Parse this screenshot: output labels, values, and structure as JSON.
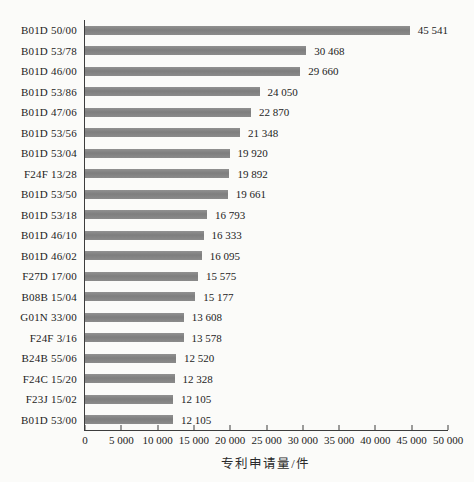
{
  "chart_data": {
    "type": "bar",
    "orientation": "horizontal",
    "xlabel": "专利申请量/件",
    "ylabel": "",
    "xlim": [
      0,
      50000
    ],
    "grid": false,
    "legend": "none",
    "bar_color": "#848484",
    "axis_color": "#3d3d3d",
    "categories": [
      "B01D 50/00",
      "B01D 53/78",
      "B01D 46/00",
      "B01D 53/86",
      "B01D 47/06",
      "B01D 53/56",
      "B01D 53/04",
      "F24F 13/28",
      "B01D 53/50",
      "B01D 53/18",
      "B01D 46/10",
      "B01D 46/02",
      "F27D 17/00",
      "B08B 15/04",
      "G01N 33/00",
      "F24F 3/16",
      "B24B 55/06",
      "F24C 15/20",
      "F23J 15/02",
      "B01D 53/00"
    ],
    "values": [
      45541,
      30468,
      29660,
      24050,
      22870,
      21348,
      19920,
      19892,
      19661,
      16793,
      16333,
      16095,
      15575,
      15177,
      13608,
      13578,
      12520,
      12328,
      12105,
      12105
    ],
    "value_labels": [
      "45 541",
      "30 468",
      "29 660",
      "24 050",
      "22 870",
      "21 348",
      "19 920",
      "19 892",
      "19 661",
      "16 793",
      "16 333",
      "16 095",
      "15 575",
      "15 177",
      "13 608",
      "13 578",
      "12 520",
      "12 328",
      "12 105",
      "12 105"
    ],
    "x_ticks": [
      {
        "value": 0,
        "label": "0"
      },
      {
        "value": 5000,
        "label": "5 000"
      },
      {
        "value": 10000,
        "label": "10 000"
      },
      {
        "value": 15000,
        "label": "15 000"
      },
      {
        "value": 20000,
        "label": "20 000"
      },
      {
        "value": 25000,
        "label": "25 000"
      },
      {
        "value": 30000,
        "label": "30 000"
      },
      {
        "value": 35000,
        "label": "35 000"
      },
      {
        "value": 40000,
        "label": "40 000"
      },
      {
        "value": 45000,
        "label": "45 000"
      },
      {
        "value": 50000,
        "label": "50 000"
      }
    ]
  }
}
